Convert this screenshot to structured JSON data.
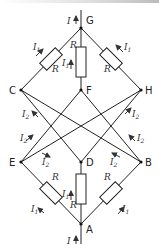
{
  "diagram": {
    "type": "resistor-network",
    "nodes": [
      {
        "id": "G",
        "x": 81,
        "y": 28
      },
      {
        "id": "C",
        "x": 21,
        "y": 90
      },
      {
        "id": "F",
        "x": 81,
        "y": 90
      },
      {
        "id": "H",
        "x": 141,
        "y": 90
      },
      {
        "id": "E",
        "x": 21,
        "y": 162
      },
      {
        "id": "D",
        "x": 81,
        "y": 162
      },
      {
        "id": "B",
        "x": 141,
        "y": 162
      },
      {
        "id": "A",
        "x": 81,
        "y": 224
      }
    ],
    "resistors": [
      {
        "between": "C-G",
        "label": "R",
        "current": "I1"
      },
      {
        "between": "F-G",
        "label": "R",
        "current": "I1"
      },
      {
        "between": "H-G",
        "label": "R",
        "current": "I1"
      },
      {
        "between": "A-E",
        "label": "R",
        "current": "I1"
      },
      {
        "between": "A-D",
        "label": "R",
        "current": "I1"
      },
      {
        "between": "A-B",
        "label": "R",
        "current": "I1"
      }
    ],
    "wires": [
      "E-C",
      "E-F",
      "E-H",
      "D-C",
      "D-H",
      "B-C",
      "B-F",
      "B-H"
    ],
    "labels": {
      "total_current": "I",
      "branch_current_1": "I",
      "branch_current_1_sub": "1",
      "branch_current_2": "I",
      "branch_current_2_sub": "2",
      "resistor": "R"
    },
    "node_names": {
      "G": "G",
      "C": "C",
      "F": "F",
      "H": "H",
      "E": "E",
      "D": "D",
      "B": "B",
      "A": "A"
    }
  }
}
